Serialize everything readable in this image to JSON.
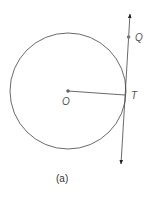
{
  "diagram": {
    "caption": "(a)",
    "points": {
      "center": {
        "label": "O"
      },
      "tangent_point": {
        "label": "T"
      },
      "point_on_line": {
        "label": "Q"
      }
    },
    "colors": {
      "stroke": "#444444",
      "point": "#666666",
      "label": "#555555"
    }
  }
}
